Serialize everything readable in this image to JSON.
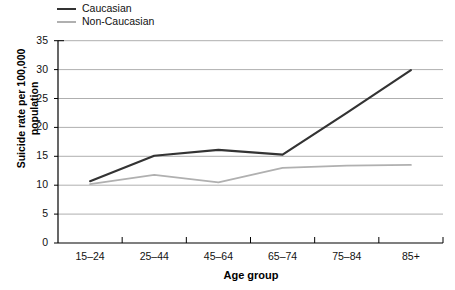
{
  "chart_data": {
    "type": "line",
    "title": "",
    "xlabel": "Age group",
    "ylabel": "Suicide rate per 100,000 population",
    "categories": [
      "15–24",
      "25–44",
      "45–64",
      "65–74",
      "75–84",
      "85+"
    ],
    "series": [
      {
        "name": "Caucasian",
        "color": "#333333",
        "values": [
          10.7,
          15.1,
          16.1,
          15.3,
          22.5,
          29.9
        ]
      },
      {
        "name": "Non-Caucasian",
        "color": "#b0b0b0",
        "values": [
          10.2,
          11.8,
          10.5,
          13.0,
          13.4,
          13.5
        ]
      }
    ],
    "ylim": [
      0,
      35
    ],
    "yticks": [
      0,
      5,
      10,
      15,
      20,
      25,
      30,
      35
    ],
    "ytick_labels": [
      "0",
      "5",
      "10",
      "15",
      "20",
      "25",
      "30",
      "35"
    ],
    "grid": true,
    "grid_axis": "y",
    "legend_position": "top-left"
  }
}
